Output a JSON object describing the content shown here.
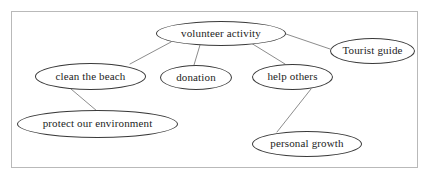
{
  "diagram": {
    "type": "mind-map",
    "frame": {
      "border_color": "#b9b9b9",
      "background_color": "#ffffff"
    },
    "style": {
      "node_border_color": "#3a3a3a",
      "node_fill_color": "#ffffff",
      "text_color": "#1d1d1d",
      "edge_color": "#6e6e6e"
    },
    "root": {
      "id": "volunteer-activity",
      "label": "volunteer activity"
    },
    "nodes": [
      {
        "id": "volunteer-activity",
        "label": "volunteer activity"
      },
      {
        "id": "tourist-guide",
        "label": "Tourist guide"
      },
      {
        "id": "clean-the-beach",
        "label": "clean the beach"
      },
      {
        "id": "donation",
        "label": "donation"
      },
      {
        "id": "help-others",
        "label": "help others"
      },
      {
        "id": "protect-our-environment",
        "label": "protect our environment"
      },
      {
        "id": "personal-growth",
        "label": "personal growth"
      }
    ],
    "edges": [
      {
        "from": "volunteer-activity",
        "to": "clean-the-beach"
      },
      {
        "from": "volunteer-activity",
        "to": "donation"
      },
      {
        "from": "volunteer-activity",
        "to": "help-others"
      },
      {
        "from": "volunteer-activity",
        "to": "tourist-guide"
      },
      {
        "from": "clean-the-beach",
        "to": "protect-our-environment"
      },
      {
        "from": "help-others",
        "to": "personal-growth"
      }
    ]
  }
}
